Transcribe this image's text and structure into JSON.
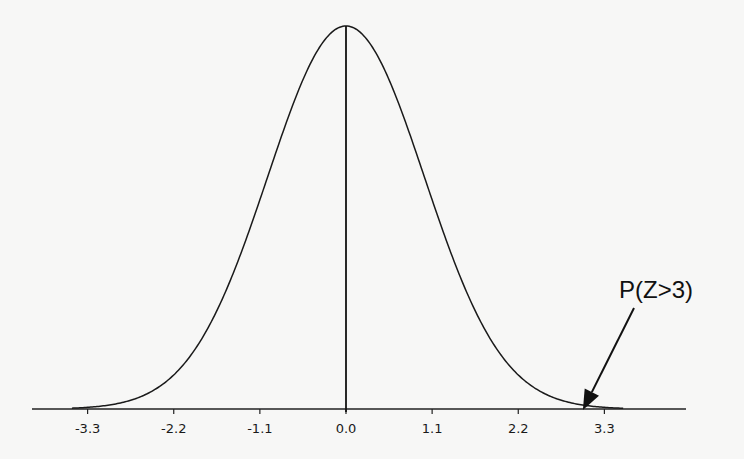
{
  "chart_data": {
    "type": "line",
    "title": "",
    "xlabel": "",
    "ylabel": "",
    "distribution": {
      "name": "standard normal",
      "mean": 0,
      "sd": 1
    },
    "x_ticks": [
      -3.3,
      -2.2,
      -1.1,
      0.0,
      1.1,
      2.2,
      3.3
    ],
    "x_tick_labels": [
      "-3.3",
      "-2.2",
      "-1.1",
      "0.0",
      "1.1",
      "2.2",
      "3.3"
    ],
    "xlim": [
      -3.8,
      4.6
    ],
    "ylim": [
      0,
      0.4
    ],
    "grid": false,
    "legend": null,
    "center_line_x": 0,
    "series": [
      {
        "name": "standard normal pdf",
        "x": [
          -3.5,
          -3.0,
          -2.5,
          -2.0,
          -1.5,
          -1.0,
          -0.5,
          0.0,
          0.5,
          1.0,
          1.5,
          2.0,
          2.5,
          3.0,
          3.5
        ],
        "values": [
          0.0009,
          0.0044,
          0.0175,
          0.054,
          0.1295,
          0.242,
          0.3521,
          0.3989,
          0.3521,
          0.242,
          0.1295,
          0.054,
          0.0175,
          0.0044,
          0.0009
        ]
      }
    ],
    "annotations": [
      {
        "text": "P(Z>3)",
        "arrow_to_x": 3.0,
        "arrow_to_y": 0
      }
    ]
  },
  "colors": {
    "background": "#f7f7f6",
    "ink": "#1a1a1a"
  }
}
